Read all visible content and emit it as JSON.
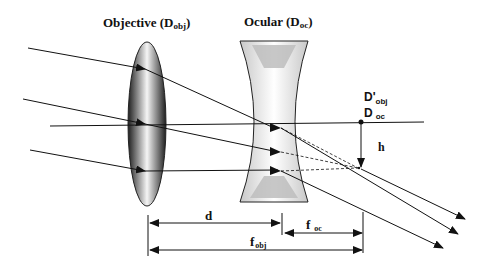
{
  "labels": {
    "objective": "Objective (D",
    "objective_sub": "obj",
    "objective_close": ")",
    "ocular": "Ocular (D",
    "ocular_sub": "oc",
    "ocular_close": ")",
    "d_obj_prime": "D'",
    "d_obj_prime_sub": "obj",
    "d_oc": "D",
    "d_oc_sub": "oc",
    "h": "h",
    "d": "d",
    "f_oc": "f",
    "f_oc_sub": "oc",
    "f_obj": "f",
    "f_obj_sub": "obj"
  },
  "colors": {
    "line": "#111111",
    "lens_dark": "#3a3a3a",
    "lens_light": "#f4f4f4"
  }
}
